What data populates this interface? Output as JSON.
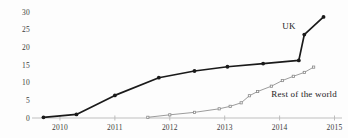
{
  "chart_data": {
    "type": "line",
    "title": "",
    "xlabel": "",
    "ylabel": "",
    "xlim": [
      2009.6,
      2015.1
    ],
    "ylim": [
      0,
      30
    ],
    "grid": false,
    "legend_position": "inline-annotation",
    "ytick_labels": [
      "0",
      "5",
      "10",
      "15",
      "20",
      "25",
      "30"
    ],
    "yticks": [
      0,
      5,
      10,
      15,
      20,
      25,
      30
    ],
    "xtick_labels": [
      "2010",
      "2011",
      "2012",
      "2013",
      "2014",
      "2015"
    ],
    "xticks": [
      2010,
      2011,
      2012,
      2013,
      2014,
      2015
    ],
    "series": [
      {
        "name": "UK",
        "color": "#1a1a1a",
        "marker": "circle",
        "x": [
          2009.7,
          2010.3,
          2011.0,
          2011.8,
          2012.45,
          2013.05,
          2013.7,
          2014.35,
          2014.45,
          2014.8
        ],
        "values": [
          0.2,
          1.0,
          6.4,
          11.4,
          13.3,
          14.5,
          15.4,
          16.3,
          23.6,
          28.6
        ]
      },
      {
        "name": "Rest of the world",
        "color": "#8a8a8a",
        "marker": "small-square",
        "x": [
          2011.6,
          2012.0,
          2012.45,
          2012.9,
          2013.1,
          2013.3,
          2013.45,
          2013.6,
          2013.85,
          2014.05,
          2014.25,
          2014.45,
          2014.62
        ],
        "values": [
          0.2,
          0.9,
          1.6,
          2.6,
          3.3,
          4.3,
          6.3,
          7.5,
          9.0,
          10.6,
          11.8,
          12.9,
          14.4
        ]
      }
    ],
    "annotations": [
      {
        "text": "UK",
        "x": 2014.05,
        "y": 25.8
      },
      {
        "text": "Rest of the world",
        "x": 2013.85,
        "y": 6.4
      }
    ]
  }
}
